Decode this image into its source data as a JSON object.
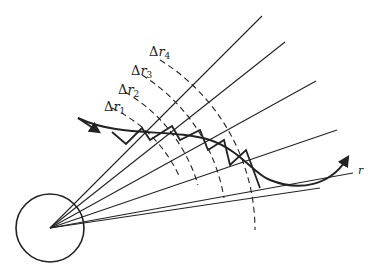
{
  "diagram": {
    "labels": {
      "dr1": {
        "delta": "Δ",
        "var": "r",
        "sub": "1"
      },
      "dr2": {
        "delta": "Δ",
        "var": "r",
        "sub": "2"
      },
      "dr3": {
        "delta": "Δ",
        "var": "r",
        "sub": "3"
      },
      "dr4": {
        "delta": "Δ",
        "var": "r",
        "sub": "4"
      },
      "r_axis": "r"
    },
    "elements": [
      "circle",
      "radial-rays",
      "dashed-arcs",
      "ray-path-with-arrows",
      "stepped-path"
    ],
    "colors": {
      "stroke": "#222222",
      "background": "#ffffff"
    }
  }
}
